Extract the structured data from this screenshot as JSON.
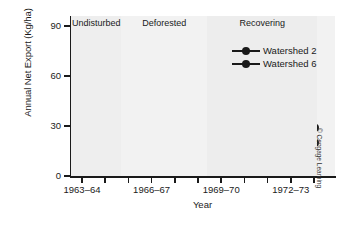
{
  "chart_data": {
    "type": "line",
    "title": "",
    "xlabel": "Year",
    "ylabel": "Annual Net Export (Kg/ha)",
    "ylim": [
      0,
      96
    ],
    "yticks": [
      0,
      30,
      60,
      90
    ],
    "ytick_labels": [
      "0",
      "30",
      "60",
      "90"
    ],
    "grid": false,
    "legend_position": "top-right",
    "x": [
      "1963-64",
      "1964-65",
      "1965-66",
      "1966-67",
      "1967-68",
      "1968-69",
      "1969-70",
      "1970-71",
      "1971-72",
      "1972-73",
      "1973-74"
    ],
    "xtick_labels": [
      "1963–64",
      "1966–67",
      "1969–70",
      "1972–73"
    ],
    "xtick_positions": [
      0,
      3,
      6,
      9
    ],
    "series": [
      {
        "name": "Watershed 2",
        "color": "#1a1a1a",
        "values": [
          14,
          8,
          17,
          77,
          91,
          72,
          68,
          42,
          22,
          24,
          29
        ]
      },
      {
        "name": "Watershed 6",
        "color": "#1a1a1a",
        "values": [
          7,
          4,
          8,
          10,
          11,
          12,
          15,
          13,
          11,
          15,
          20
        ]
      }
    ],
    "bands": [
      {
        "label": "Undisturbed",
        "start_index": 0,
        "end_index": 2.15,
        "color": "#eeeeee"
      },
      {
        "label": "Deforested",
        "start_index": 2.15,
        "end_index": 5.85,
        "color": "#f2f2f2"
      },
      {
        "label": "Recovering",
        "start_index": 5.85,
        "end_index": 10.6,
        "color": "#ededed"
      }
    ]
  },
  "credit": "© Cengage Learning"
}
